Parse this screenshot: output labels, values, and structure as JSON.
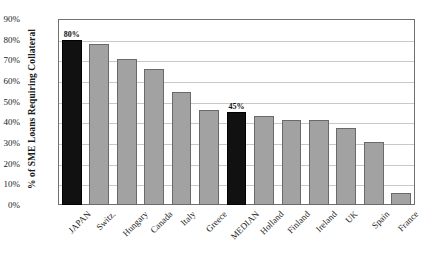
{
  "chart_data": {
    "type": "bar",
    "title": "",
    "subtitle": "",
    "xlabel": "",
    "ylabel": "% of SME Loans Requiring Collateral",
    "ylim": [
      0,
      90
    ],
    "ytick_labels": [
      "90%",
      "80%",
      "70%",
      "60%",
      "50%",
      "40%",
      "30%",
      "20%",
      "10%",
      "0%"
    ],
    "ytick_values": [
      90,
      80,
      70,
      60,
      50,
      40,
      30,
      20,
      10,
      0
    ],
    "grid": true,
    "legend": "none",
    "categories": [
      "JAPAN",
      "Switz.",
      "Hungary",
      "Canada",
      "Italy",
      "Greece",
      "MEDIAN",
      "Holland",
      "Finland",
      "Ireland",
      "UK",
      "Spain",
      "France"
    ],
    "values": [
      80,
      78,
      70.5,
      66,
      54.5,
      46,
      45,
      43,
      41,
      41,
      37.5,
      30.5,
      6
    ],
    "data_labels": [
      {
        "category": "JAPAN",
        "text": "80%"
      },
      {
        "category": "MEDIAN",
        "text": "45%"
      }
    ],
    "highlighted": [
      "JAPAN",
      "MEDIAN"
    ],
    "colors": {
      "bar": "#a2a2a2",
      "bar_edge": "#6a6a6a",
      "bar_highlight": "#111111",
      "gridline": "#c8c8c8",
      "frame": "#707070",
      "text": "#1b1b1b",
      "background": "#ffffff"
    }
  }
}
